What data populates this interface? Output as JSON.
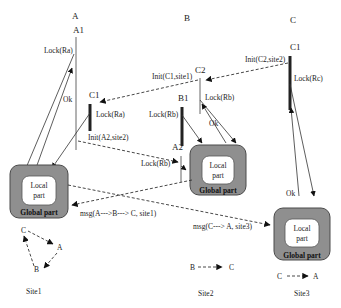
{
  "diagram": {
    "transactions": [
      {
        "id": "A",
        "label": "A"
      },
      {
        "id": "B",
        "label": "B"
      },
      {
        "id": "C",
        "label": "C"
      }
    ],
    "subtransactions": {
      "A1": "A1",
      "C1_site1": "C1",
      "C2": "C2",
      "B1": "B1",
      "A2": "A2",
      "C1_site3": "C1"
    },
    "messages": {
      "lock_ra_a1": "Lock(Ra)",
      "ok_a1": "Ok",
      "lock_ra_c1": "Lock(Ra)",
      "init_a2_site2": "Init(A2,site2)",
      "init_c1_site1": "Init(C1,site1)",
      "init_c2_site2": "Init(C2,site2)",
      "lock_rb_c2": "Lock(Rb)",
      "lock_rb_b1": "Lock(Rb)",
      "ok_b": "Ok",
      "lock_rb_a2": "Lock(Rb)",
      "lock_rc": "Lock(Rc)",
      "ok_c": "Ok",
      "msg_site1": "msg(A--->B---> C, site1)",
      "msg_site3": "msg(C---> A, site3)"
    },
    "sites": [
      {
        "name": "Site1",
        "local": "Local part",
        "local_l1": "Local",
        "local_l2": "part",
        "global": "Global part",
        "wfg": {
          "nodes": [
            "C",
            "A",
            "B"
          ],
          "edges": [
            "C->A",
            "A->B",
            "B->C"
          ]
        }
      },
      {
        "name": "Site2",
        "local": "Local part",
        "local_l1": "Local",
        "local_l2": "part",
        "global": "Global part",
        "wfg": {
          "nodes": [
            "B",
            "C"
          ],
          "edges": [
            "B->C"
          ]
        }
      },
      {
        "name": "Site3",
        "local": "Local part",
        "local_l1": "Local",
        "local_l2": "part",
        "global": "Global part",
        "wfg": {
          "nodes": [
            "C",
            "A"
          ],
          "edges": [
            "C->A"
          ]
        }
      }
    ]
  }
}
